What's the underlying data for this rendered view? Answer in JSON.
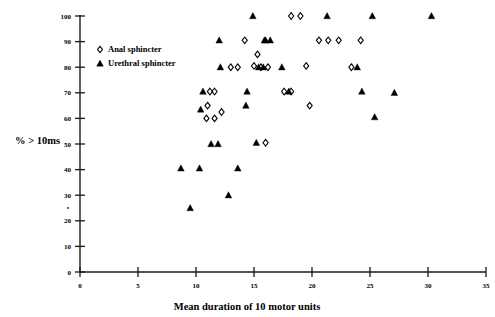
{
  "chart_data": {
    "type": "scatter",
    "title": "",
    "xlabel": "Mean duration of 10 motor units",
    "ylabel": "% > 10ms",
    "xlim": [
      0,
      35
    ],
    "ylim": [
      0,
      100
    ],
    "xticks": [
      0,
      5,
      10,
      15,
      20,
      25,
      30,
      35
    ],
    "xtick_labels": [
      "0",
      "5",
      "10",
      "15",
      "20",
      "25",
      "30",
      "35"
    ],
    "yticks": [
      0,
      10,
      20,
      30,
      40,
      50,
      60,
      70,
      80,
      90,
      100
    ],
    "ytick_labels": [
      "0",
      "10",
      "20",
      "30",
      "40",
      "50",
      "60",
      "70",
      "80",
      "90",
      "100"
    ],
    "grid": false,
    "legend_position": "upper-left-inside",
    "series": [
      {
        "name": "Anal sphincter",
        "marker": "open-diamond",
        "color": "#000000",
        "points": [
          [
            11.2,
            70.5
          ],
          [
            11.6,
            70.5
          ],
          [
            11.0,
            65.0
          ],
          [
            10.9,
            60.0
          ],
          [
            11.6,
            60.0
          ],
          [
            12.2,
            62.5
          ],
          [
            13.0,
            80.0
          ],
          [
            13.6,
            80.0
          ],
          [
            14.2,
            90.5
          ],
          [
            15.0,
            80.5
          ],
          [
            15.3,
            85.0
          ],
          [
            15.6,
            80.0
          ],
          [
            16.2,
            80.0
          ],
          [
            16.0,
            50.5
          ],
          [
            17.6,
            70.5
          ],
          [
            18.2,
            70.5
          ],
          [
            18.2,
            100.0
          ],
          [
            19.0,
            100.0
          ],
          [
            19.5,
            80.5
          ],
          [
            19.8,
            65.0
          ],
          [
            20.6,
            90.5
          ],
          [
            21.4,
            90.5
          ],
          [
            22.3,
            90.5
          ],
          [
            23.4,
            80.0
          ],
          [
            24.2,
            90.5
          ]
        ]
      },
      {
        "name": "Urethral sphincter",
        "marker": "filled-triangle",
        "color": "#000000",
        "points": [
          [
            8.7,
            40.5
          ],
          [
            9.5,
            25.0
          ],
          [
            10.3,
            40.5
          ],
          [
            10.6,
            70.5
          ],
          [
            10.4,
            63.5
          ],
          [
            11.3,
            50.0
          ],
          [
            11.9,
            50.0
          ],
          [
            12.1,
            80.0
          ],
          [
            12.0,
            90.5
          ],
          [
            12.8,
            30.0
          ],
          [
            13.6,
            40.5
          ],
          [
            14.3,
            65.0
          ],
          [
            14.4,
            70.5
          ],
          [
            14.9,
            100.0
          ],
          [
            15.4,
            80.0
          ],
          [
            15.8,
            80.0
          ],
          [
            15.9,
            90.5
          ],
          [
            16.0,
            90.5
          ],
          [
            16.4,
            90.5
          ],
          [
            15.2,
            50.5
          ],
          [
            17.4,
            80.0
          ],
          [
            18.0,
            70.5
          ],
          [
            21.3,
            100.0
          ],
          [
            23.9,
            80.0
          ],
          [
            24.3,
            70.5
          ],
          [
            25.2,
            100.0
          ],
          [
            25.4,
            60.5
          ],
          [
            27.1,
            70.0
          ],
          [
            30.3,
            100.0
          ]
        ]
      }
    ]
  },
  "legend": {
    "items": [
      {
        "label": "Anal sphincter",
        "marker": "open-diamond"
      },
      {
        "label": "Urethral sphincter",
        "marker": "filled-triangle"
      }
    ]
  },
  "axes": {
    "x_title": "Mean duration of 10 motor units",
    "y_title": "% > 10ms"
  }
}
